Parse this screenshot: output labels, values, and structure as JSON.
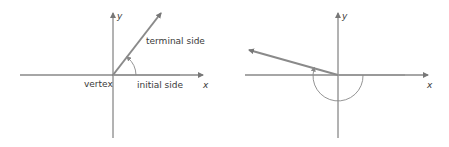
{
  "colors": {
    "background": "#ffffff",
    "axis": "#777777",
    "ray": "#8a8a8a",
    "arc": "#8a8a8a",
    "text": "#3a3a3a"
  },
  "figures": [
    {
      "name": "positive-angle",
      "labels": {
        "y_axis": "y",
        "x_axis": "x",
        "terminal_side": "terminal side",
        "initial_side": "initial side",
        "vertex": "vertex"
      },
      "angle_direction": "counterclockwise",
      "approx_angle_deg": 50
    },
    {
      "name": "negative-angle",
      "labels": {
        "y_axis": "y",
        "x_axis": "x"
      },
      "angle_direction": "clockwise",
      "approx_angle_deg": -195
    }
  ]
}
